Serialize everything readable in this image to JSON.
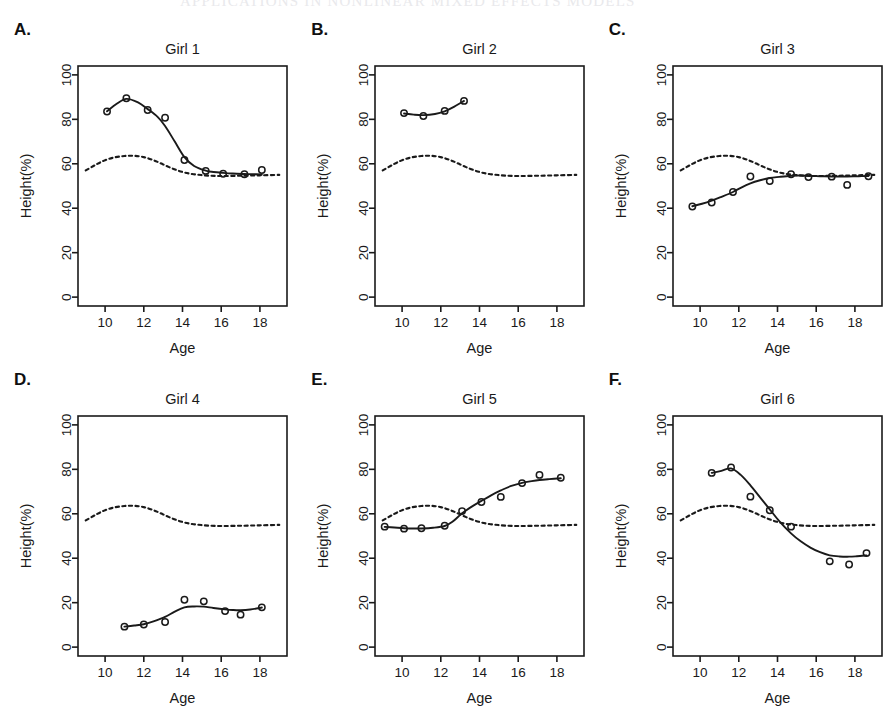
{
  "header": {
    "running_head": "APPLICATIONS IN NONLINEAR MIXED EFFECTS MODELS"
  },
  "figure": {
    "background_color": "#ffffff",
    "ink_color": "#1a1a1a"
  },
  "chart_data": {
    "type": "line",
    "title": "",
    "xlabel": "Age",
    "ylabel": "Height(%)",
    "xlim": [
      8.6,
      19.4
    ],
    "ylim": [
      -4,
      104
    ],
    "xticks": [
      10,
      12,
      14,
      16,
      18
    ],
    "yticks": [
      0,
      20,
      40,
      60,
      80,
      100
    ],
    "grid": false,
    "legend": "none",
    "marker": "open-circle",
    "panel_layout": "3 columns x 2 rows",
    "series_styles": {
      "observed": "open circles",
      "subject_fit": "solid line",
      "population_average": "dashed line"
    },
    "population_average_curve": {
      "name": "Population average (dashed)",
      "x": [
        9.0,
        9.5,
        10.0,
        10.5,
        11.0,
        11.5,
        12.0,
        12.5,
        13.0,
        13.5,
        14.0,
        14.5,
        15.0,
        15.5,
        16.0,
        17.0,
        18.0,
        19.0
      ],
      "y": [
        57.0,
        59.5,
        61.6,
        62.9,
        63.5,
        63.6,
        63.0,
        61.6,
        59.7,
        57.8,
        56.3,
        55.4,
        54.9,
        54.6,
        54.5,
        54.6,
        54.8,
        55.0
      ]
    },
    "panels": [
      {
        "letter": "A.",
        "title": "Girl 1",
        "observed": {
          "x": [
            10.1,
            11.1,
            12.2,
            13.1,
            14.1,
            15.2,
            16.1,
            17.2,
            18.1
          ],
          "y": [
            83.5,
            89.5,
            84.2,
            80.7,
            61.7,
            56.8,
            55.5,
            55.3,
            57.2
          ]
        },
        "fit": {
          "x": [
            10.1,
            10.6,
            11.1,
            11.7,
            12.2,
            12.7,
            13.1,
            13.6,
            14.1,
            14.6,
            15.2,
            15.6,
            16.1,
            16.6,
            17.2,
            17.6,
            18.1
          ],
          "y": [
            83.6,
            87.0,
            89.2,
            87.6,
            84.6,
            81.2,
            77.0,
            70.0,
            63.0,
            59.0,
            56.9,
            56.3,
            55.9,
            55.6,
            55.4,
            55.3,
            55.2
          ]
        }
      },
      {
        "letter": "B.",
        "title": "Girl 2",
        "observed": {
          "x": [
            10.1,
            11.1,
            12.2,
            13.2
          ],
          "y": [
            82.8,
            81.5,
            83.8,
            88.3
          ]
        },
        "fit": {
          "x": [
            10.1,
            10.6,
            11.1,
            11.7,
            12.2,
            12.7,
            13.2
          ],
          "y": [
            82.6,
            82.1,
            81.9,
            82.4,
            83.6,
            85.7,
            88.3
          ]
        }
      },
      {
        "letter": "C.",
        "title": "Girl 3",
        "observed": {
          "x": [
            9.6,
            10.6,
            11.7,
            12.6,
            13.6,
            14.7,
            15.6,
            16.8,
            17.6,
            18.7
          ],
          "y": [
            40.8,
            42.6,
            47.3,
            54.3,
            52.2,
            55.3,
            54.0,
            54.2,
            50.5,
            54.4
          ]
        },
        "fit": {
          "x": [
            9.6,
            10.1,
            10.6,
            11.1,
            11.7,
            12.1,
            12.6,
            13.1,
            13.6,
            14.1,
            14.7,
            15.1,
            15.6,
            16.2,
            16.8,
            17.2,
            17.6,
            18.2,
            18.7
          ],
          "y": [
            40.9,
            42.0,
            43.4,
            45.1,
            47.3,
            49.2,
            51.2,
            52.6,
            53.6,
            54.1,
            54.6,
            54.7,
            54.6,
            54.4,
            54.3,
            54.3,
            54.3,
            54.4,
            54.5
          ]
        }
      },
      {
        "letter": "D.",
        "title": "Girl 4",
        "observed": {
          "x": [
            11.0,
            12.0,
            13.1,
            14.1,
            15.1,
            16.2,
            17.0,
            18.1
          ],
          "y": [
            9.2,
            10.2,
            11.3,
            21.3,
            20.6,
            16.2,
            14.6,
            17.9
          ]
        },
        "fit": {
          "x": [
            11.0,
            11.5,
            12.0,
            12.5,
            13.1,
            13.6,
            14.1,
            14.6,
            15.1,
            15.6,
            16.2,
            16.6,
            17.0,
            17.5,
            18.1
          ],
          "y": [
            9.2,
            9.7,
            10.3,
            11.6,
            13.6,
            16.0,
            17.9,
            18.3,
            18.2,
            17.6,
            17.0,
            16.7,
            16.6,
            16.9,
            17.8
          ]
        }
      },
      {
        "letter": "E.",
        "title": "Girl 5",
        "observed": {
          "x": [
            9.1,
            10.1,
            11.0,
            12.2,
            13.1,
            14.1,
            15.1,
            16.2,
            17.1,
            18.2
          ],
          "y": [
            54.2,
            53.3,
            53.5,
            54.6,
            61.2,
            65.3,
            67.6,
            73.8,
            77.5,
            76.2
          ]
        },
        "fit": {
          "x": [
            9.1,
            9.6,
            10.1,
            10.5,
            11.0,
            11.6,
            12.2,
            12.6,
            13.1,
            13.6,
            14.1,
            14.6,
            15.1,
            15.6,
            16.2,
            16.7,
            17.1,
            17.6,
            18.2
          ],
          "y": [
            54.1,
            53.8,
            53.5,
            53.4,
            53.4,
            53.7,
            54.5,
            56.4,
            60.2,
            63.2,
            65.8,
            68.3,
            70.5,
            72.4,
            73.9,
            74.7,
            75.2,
            75.6,
            76.0
          ]
        }
      },
      {
        "letter": "F.",
        "title": "Girl 6",
        "observed": {
          "x": [
            10.6,
            11.6,
            12.6,
            13.6,
            14.7,
            16.7,
            17.7,
            18.6
          ],
          "y": [
            78.4,
            80.8,
            67.7,
            61.6,
            54.2,
            38.6,
            37.2,
            42.3
          ]
        },
        "fit": {
          "x": [
            10.6,
            11.1,
            11.6,
            12.1,
            12.6,
            13.1,
            13.6,
            14.1,
            14.7,
            15.2,
            15.7,
            16.2,
            16.7,
            17.2,
            17.7,
            18.1,
            18.6
          ],
          "y": [
            78.4,
            79.3,
            80.4,
            77.5,
            72.8,
            67.4,
            62.0,
            56.6,
            51.2,
            47.6,
            44.8,
            42.7,
            41.3,
            40.8,
            40.7,
            40.9,
            41.3
          ]
        }
      }
    ]
  }
}
